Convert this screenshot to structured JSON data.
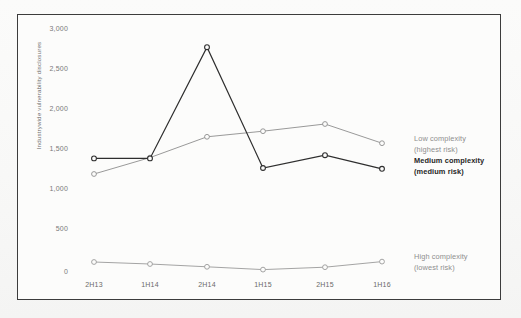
{
  "figure": {
    "frame_border_color": "#3c3c3c",
    "plot_background": "#fcfcfb"
  },
  "axis": {
    "y_title": "Industrywide vulnerability disclosures",
    "y_ticks": [
      "3,000",
      "2,500",
      "2,000",
      "1,500",
      "1,000",
      "500",
      "0"
    ],
    "x_ticks": [
      "2H13",
      "1H14",
      "2H14",
      "1H15",
      "2H15",
      "1H16"
    ]
  },
  "legend": {
    "low": {
      "line1": "Low complexity",
      "line2": "(highest risk)",
      "color": "#8e8e8e"
    },
    "medium": {
      "line1": "Medium complexity",
      "line2": "(medium risk)",
      "color": "#262626"
    },
    "high": {
      "line1": "High complexity",
      "line2": "(lowest risk)",
      "color": "#8e8e8e"
    }
  },
  "chart_data": {
    "type": "line",
    "title": "",
    "xlabel": "",
    "ylabel": "Industrywide vulnerability disclosures",
    "categories": [
      "2H13",
      "1H14",
      "2H14",
      "1H15",
      "2H15",
      "1H16"
    ],
    "ylim": [
      0,
      3000
    ],
    "ytick_values": [
      0,
      500,
      1000,
      1500,
      2000,
      2500,
      3000
    ],
    "grid": false,
    "legend_position": "right",
    "series": [
      {
        "name": "Low complexity (highest risk)",
        "color": "#8d8d8d",
        "values": [
          1225,
          1430,
          1690,
          1760,
          1850,
          1610
        ]
      },
      {
        "name": "Medium complexity (medium risk)",
        "color": "#2e2e2e",
        "values": [
          1420,
          1420,
          2810,
          1300,
          1460,
          1290
        ]
      },
      {
        "name": "High complexity (lowest risk)",
        "color": "#9a9a9a",
        "values": [
          125,
          100,
          65,
          30,
          60,
          130
        ]
      }
    ]
  }
}
